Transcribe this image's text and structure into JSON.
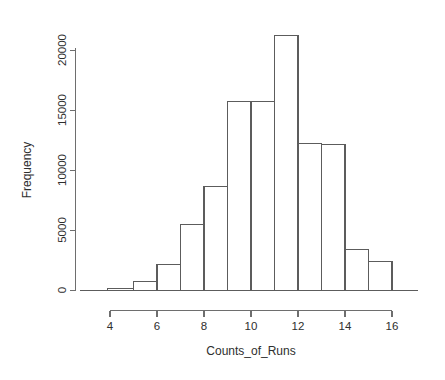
{
  "chart_data": {
    "type": "bar",
    "title": "",
    "subtitle": "",
    "xlabel": "Counts_of_Runs",
    "ylabel": "Frequency",
    "categories": [
      "4-5",
      "5-6",
      "6-7",
      "7-8",
      "8-9",
      "9-10",
      "10-11",
      "11-12",
      "12-13",
      "13-14",
      "14-15",
      "15-16",
      "16-17"
    ],
    "bin_edges": [
      3.9,
      5,
      6,
      7,
      8,
      9,
      10,
      11,
      12,
      13,
      14,
      15,
      16,
      17
    ],
    "values": [
      60,
      170,
      750,
      2200,
      5500,
      8700,
      15800,
      15800,
      21300,
      12300,
      12200,
      3400,
      2450
    ],
    "bars": [
      {
        "x0": 3.9,
        "x1": 5,
        "value": 170
      },
      {
        "x0": 5,
        "x1": 6,
        "value": 750
      },
      {
        "x0": 6,
        "x1": 7,
        "value": 2200
      },
      {
        "x0": 7,
        "x1": 8,
        "value": 5500
      },
      {
        "x0": 8,
        "x1": 9,
        "value": 8700
      },
      {
        "x0": 9,
        "x1": 10,
        "value": 15800
      },
      {
        "x0": 10,
        "x1": 11,
        "value": 15800
      },
      {
        "x0": 11,
        "x1": 12,
        "value": 21300
      },
      {
        "x0": 12,
        "x1": 13,
        "value": 12300
      },
      {
        "x0": 13,
        "x1": 14,
        "value": 12200
      },
      {
        "x0": 14,
        "x1": 15,
        "value": 3400
      },
      {
        "x0": 15,
        "x1": 16,
        "value": 2450
      }
    ],
    "xlim": [
      3.3,
      17.1
    ],
    "ylim": [
      0,
      21300
    ],
    "x_ticks": [
      4,
      6,
      8,
      10,
      12,
      14,
      16
    ],
    "x_tick_labels": [
      "4",
      "6",
      "8",
      "10",
      "12",
      "14",
      "16"
    ],
    "y_ticks": [
      0,
      5000,
      10000,
      15000,
      20000
    ],
    "y_tick_labels": [
      "0",
      "5000",
      "10000",
      "15000",
      "20000"
    ],
    "grid": false,
    "legend": false,
    "legend_position": "none",
    "colors": {
      "bar_fill": "#ffffff",
      "bar_stroke": "#5c5c5c",
      "axis": "#6e6e6e",
      "text": "#2e2e2e",
      "background": "#ffffff"
    }
  }
}
